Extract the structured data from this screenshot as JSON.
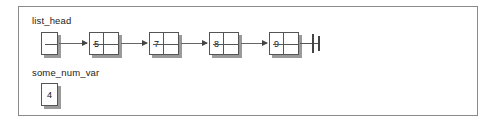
{
  "figure": {
    "type": "linked-list-diagram",
    "background_color": "#ffffff",
    "panel_border_color": "#8a8a8a",
    "panel_shadow_color": "#5a5a5a",
    "box_border_color": "#555555",
    "box_shadow_color": "#9a9a9a",
    "arrow_color": "#666666"
  },
  "list_head": {
    "label": "list_head",
    "head_pointer_value": "",
    "nodes": [
      {
        "value": "5",
        "pointer": ""
      },
      {
        "value": "7",
        "pointer": ""
      },
      {
        "value": "8",
        "pointer": ""
      },
      {
        "value": "9",
        "pointer": ""
      }
    ],
    "terminator": "null-ground-symbol"
  },
  "some_num_var": {
    "label": "some_num_var",
    "value": "4"
  }
}
